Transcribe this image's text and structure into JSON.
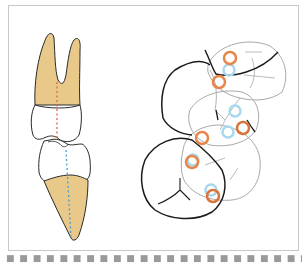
{
  "figure": {
    "type": "dental illustration",
    "left_panel": {
      "description": "Lateral view of upper and lower teeth in occlusion with root axis lines",
      "upper_tooth": {
        "root_color": "#E8C98A",
        "axis_line_color": "#E8663A",
        "axis_style": "dashed"
      },
      "lower_tooth": {
        "root_color": "#E8C98A",
        "axis_line_color": "#4A9BD1",
        "axis_style": "dashed"
      }
    },
    "right_panel": {
      "description": "Occlusal view of overlapping molar outlines with contact point markers",
      "markers": {
        "orange_contacts": 6,
        "blue_contacts": 5,
        "orange_color": "#E8864A",
        "blue_color": "#A8D8EE"
      },
      "outline_colors": {
        "dark": "#1a1a1a",
        "light": "#a8a8a8"
      }
    }
  },
  "caption": {
    "text": "■ ■ ■ ■ ■ ■ ■ ■ ■ ■ ■ ■ ■ ■ ■ ■ ■ ■ ■ ■ ■ ■ ■ ■ ■ ■ ■ ■ ■"
  }
}
